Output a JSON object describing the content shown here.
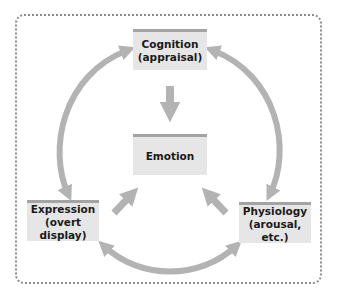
{
  "diagram": {
    "nodes": {
      "cognition": {
        "title": "Cognition",
        "subtitle": "(appraisal)"
      },
      "emotion": {
        "title": "Emotion"
      },
      "expression": {
        "title": "Expression",
        "subtitle": "(overt display)"
      },
      "physiology": {
        "title": "Physiology",
        "subtitle": "(arousal, etc.)"
      }
    },
    "edges": [
      {
        "from": "cognition",
        "to": "emotion",
        "type": "one-way"
      },
      {
        "from": "expression",
        "to": "emotion",
        "type": "one-way"
      },
      {
        "from": "physiology",
        "to": "emotion",
        "type": "one-way"
      },
      {
        "from": "cognition",
        "to": "expression",
        "type": "two-way"
      },
      {
        "from": "cognition",
        "to": "physiology",
        "type": "two-way"
      },
      {
        "from": "expression",
        "to": "physiology",
        "type": "two-way"
      }
    ],
    "colors": {
      "box_fill": "#e6e6e6",
      "box_top_rule": "#a3a3a3",
      "arrow": "#b3b3b3",
      "frame_dots": "#8c8c8c"
    }
  }
}
